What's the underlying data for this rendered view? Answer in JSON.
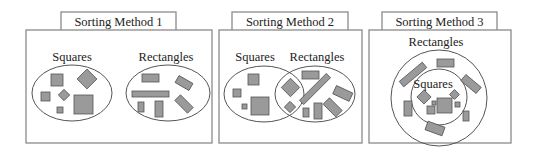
{
  "panels": [
    {
      "title": "Sorting Method 1",
      "labels": {
        "left": "Squares",
        "right": "Rectangles"
      }
    },
    {
      "title": "Sorting Method 2",
      "labels": {
        "left": "Squares",
        "right": "Rectangles"
      }
    },
    {
      "title": "Sorting Method 3",
      "labels": {
        "outer": "Rectangles",
        "inner": "Squares"
      }
    }
  ],
  "colors": {
    "shape_fill": "#9a9a9a",
    "frame": "#8a8a8a",
    "outline": "#555555"
  }
}
